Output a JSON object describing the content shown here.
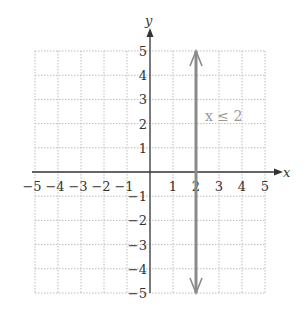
{
  "chart_data": {
    "type": "line",
    "title": "",
    "xlabel": "x",
    "ylabel": "y",
    "xlim": [
      -5,
      5
    ],
    "ylim": [
      -5,
      5
    ],
    "grid": true,
    "x_ticks": [
      "−5",
      "−4",
      "−3",
      "−2",
      "−1",
      "1",
      "2",
      "3",
      "4",
      "5"
    ],
    "y_ticks": [
      "5",
      "4",
      "3",
      "2",
      "1",
      "−1",
      "−2",
      "−3",
      "−4",
      "−5"
    ],
    "series": [
      {
        "name": "x ≤ 2",
        "x": [
          2,
          2
        ],
        "y": [
          -5,
          5
        ],
        "style": "vertical line with arrowheads both ends",
        "color": "#8a8a8a"
      }
    ],
    "annotations": [
      {
        "text": "x ≤ 2",
        "x": 3,
        "y": 2.5,
        "color": "#9a9a9a"
      }
    ]
  },
  "labels": {
    "x_axis": "x",
    "y_axis": "y",
    "annotation": "x ≤ 2"
  }
}
